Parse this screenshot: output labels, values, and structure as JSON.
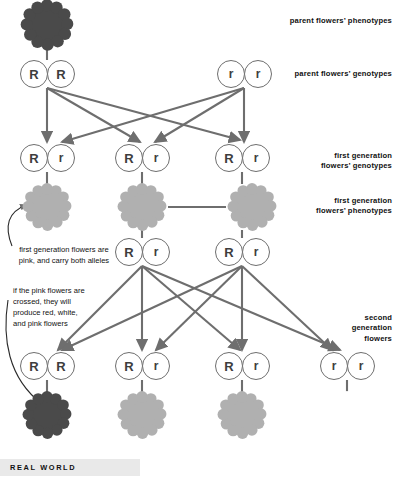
{
  "diagram": {
    "colors": {
      "red_flower": "#4a4a4a",
      "pink_flower": "#b0b0b0",
      "white_flower": "#ffffff",
      "line": "#6e6e6e",
      "circle_stroke": "#6e6e6e",
      "text": "#111111",
      "realworld_bar": "#e9e9e9"
    },
    "side_labels": [
      {
        "id": "parent-phenotypes",
        "text": "parent flowers’ phenotypes",
        "x": 288,
        "y": 14
      },
      {
        "id": "parent-genotypes",
        "text": "parent flowers’ genotypes",
        "x": 288,
        "y": 66
      },
      {
        "id": "firstgen-genotypes",
        "line1": "first generation",
        "line2": "flowers’ genotypes",
        "x": 288,
        "y": 148
      },
      {
        "id": "firstgen-phenotypes",
        "line1": "first generation",
        "line2": "flowers’ phenotypes",
        "x": 288,
        "y": 193
      },
      {
        "id": "secondgen-flowers",
        "line1": "second",
        "line2": "generation",
        "line3": "flowers",
        "x": 288,
        "y": 313
      }
    ],
    "notes": [
      {
        "id": "note-first-generation",
        "line1": "first generation flowers are",
        "line2": "pink, and carry both alleles",
        "x": 4,
        "y": 244
      },
      {
        "id": "note-pink-crossed",
        "line1": "if the pink flowers are",
        "line2": "crossed, they will",
        "line3": "produce red, white,",
        "line4": "and pink flowers",
        "x": 6,
        "y": 285
      }
    ],
    "rows": {
      "parent_phenotypes": [
        {
          "id": "parent-flower-red",
          "color_key": "red_flower",
          "cx": 47,
          "cy": 25,
          "r": 28
        }
      ],
      "parent_genotypes": [
        {
          "pair_id": "parent-genotype-RR",
          "left": "R",
          "right": "R",
          "cx": 47,
          "cy": 74
        },
        {
          "pair_id": "parent-genotype-rr",
          "left": "r",
          "right": "r",
          "cx": 244,
          "cy": 74
        }
      ],
      "first_generation_genotypes": [
        {
          "pair_id": "firstgen-genotype-1",
          "left": "R",
          "right": "r",
          "cx": 47,
          "cy": 158
        },
        {
          "pair_id": "firstgen-genotype-2",
          "left": "R",
          "right": "r",
          "cx": 142,
          "cy": 158
        },
        {
          "pair_id": "firstgen-genotype-3",
          "left": "R",
          "right": "r",
          "cx": 242,
          "cy": 158
        }
      ],
      "first_generation_phenotypes": [
        {
          "id": "firstgen-flower-pink-1",
          "color_key": "pink_flower",
          "cx": 47,
          "cy": 207,
          "r": 26
        },
        {
          "id": "firstgen-flower-pink-2",
          "color_key": "pink_flower",
          "cx": 142,
          "cy": 207,
          "r": 26
        },
        {
          "id": "firstgen-flower-pink-3",
          "color_key": "pink_flower",
          "cx": 252,
          "cy": 207,
          "r": 26
        }
      ],
      "crossed_pink_genotypes": [
        {
          "pair_id": "crossed-genotype-1",
          "left": "R",
          "right": "r",
          "cx": 142,
          "cy": 252
        },
        {
          "pair_id": "crossed-genotype-2",
          "left": "R",
          "right": "r",
          "cx": 242,
          "cy": 252
        }
      ],
      "second_generation_genotypes": [
        {
          "pair_id": "secondgen-genotype-RR",
          "left": "R",
          "right": "R",
          "cx": 47,
          "cy": 366
        },
        {
          "pair_id": "secondgen-genotype-Rr-1",
          "left": "R",
          "right": "r",
          "cx": 142,
          "cy": 366
        },
        {
          "pair_id": "secondgen-genotype-Rr-2",
          "left": "R",
          "right": "r",
          "cx": 242,
          "cy": 366
        },
        {
          "pair_id": "secondgen-genotype-rr",
          "left": "r",
          "right": "r",
          "cx": 347,
          "cy": 366
        }
      ],
      "second_generation_phenotypes": [
        {
          "id": "secondgen-flower-red",
          "color_key": "red_flower",
          "cx": 47,
          "cy": 415,
          "r": 26
        },
        {
          "id": "secondgen-flower-pink-1",
          "color_key": "pink_flower",
          "cx": 142,
          "cy": 415,
          "r": 26
        },
        {
          "id": "secondgen-flower-pink-2",
          "color_key": "pink_flower",
          "cx": 242,
          "cy": 415,
          "r": 26
        },
        {
          "id": "secondgen-flower-white",
          "color_key": "white_flower",
          "cx": 347,
          "cy": 415,
          "r": 26
        }
      ]
    }
  },
  "footer": {
    "label": "REAL WORLD"
  }
}
